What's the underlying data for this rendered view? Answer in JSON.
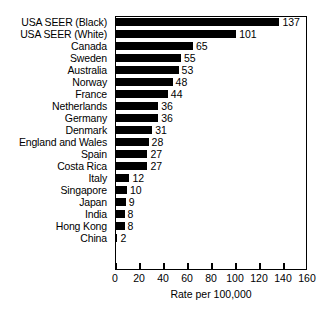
{
  "chart_data": {
    "type": "bar",
    "orientation": "horizontal",
    "title": "",
    "xlabel": "Rate per 100,000",
    "ylabel": "",
    "xlim": [
      0,
      160
    ],
    "xticks": [
      0,
      20,
      40,
      60,
      80,
      100,
      120,
      140,
      160
    ],
    "grid": false,
    "legend": null,
    "bar_color": "#000000",
    "background_color": "#ffffff",
    "show_value_labels": true,
    "categories": [
      "USA SEER (Black)",
      "USA SEER (White)",
      "Canada",
      "Sweden",
      "Australia",
      "Norway",
      "France",
      "Netherlands",
      "Germany",
      "Denmark",
      "England and Wales",
      "Spain",
      "Costa Rica",
      "Italy",
      "Singapore",
      "Japan",
      "India",
      "Hong Kong",
      "China"
    ],
    "values": [
      137,
      101,
      65,
      55,
      53,
      48,
      44,
      36,
      36,
      31,
      28,
      27,
      27,
      12,
      10,
      9,
      8,
      8,
      2
    ],
    "value_labels": [
      "137",
      "101",
      "65",
      "55",
      "53",
      "48",
      "44",
      "36",
      "36",
      "31",
      "28",
      "27",
      "27",
      "12",
      "10",
      "9",
      "8",
      "8",
      "2"
    ],
    "xtick_labels": [
      "0",
      "20",
      "40",
      "60",
      "80",
      "100",
      "120",
      "140",
      "160"
    ]
  }
}
